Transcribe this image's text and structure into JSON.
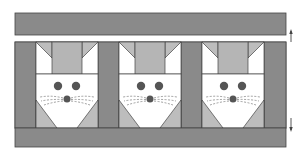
{
  "diagram": {
    "title": "",
    "type": "quilt-block-layout",
    "colors": {
      "sashing": "#8a8a8a",
      "ear": "#bdbdbd",
      "head_top": "#b5b5b5",
      "face": "#ffffff",
      "feature": "#555555",
      "outline": "#444444",
      "background": "#ffffff"
    },
    "top_border": {
      "label": "top border strip"
    },
    "bottom_border": {
      "label": "bottom border strip"
    },
    "blocks": [
      {
        "name": "mouse-block-1",
        "eyes": 2,
        "nose": 1,
        "whiskers": true
      },
      {
        "name": "mouse-block-2",
        "eyes": 2,
        "nose": 1,
        "whiskers": true
      },
      {
        "name": "mouse-block-3",
        "eyes": 2,
        "nose": 1,
        "whiskers": true
      }
    ],
    "sashing_columns": 4,
    "arrows": [
      {
        "name": "up-arrow",
        "direction": "up"
      },
      {
        "name": "down-arrow",
        "direction": "down"
      }
    ]
  }
}
